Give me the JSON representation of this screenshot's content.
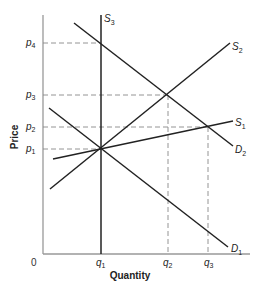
{
  "diagram": {
    "type": "supply-demand",
    "axes": {
      "x_label": "Quantity",
      "y_label": "Price",
      "origin_label": "0",
      "color": "#999999"
    },
    "curve_color": "#222222",
    "guide_color": "#888888",
    "price_ticks": [
      {
        "id": "p4",
        "base": "p",
        "sub": "4",
        "y": 43
      },
      {
        "id": "p3",
        "base": "p",
        "sub": "3",
        "y": 95
      },
      {
        "id": "p2",
        "base": "p",
        "sub": "2",
        "y": 127
      },
      {
        "id": "p1",
        "base": "p",
        "sub": "1",
        "y": 149
      }
    ],
    "quantity_ticks": [
      {
        "id": "q1",
        "base": "q",
        "sub": "1",
        "x": 101
      },
      {
        "id": "q2",
        "base": "q",
        "sub": "2",
        "x": 168
      },
      {
        "id": "q3",
        "base": "q",
        "sub": "3",
        "x": 208
      }
    ],
    "curves": [
      {
        "id": "S3",
        "base": "S",
        "sub": "3",
        "kind": "supply",
        "x1": 101,
        "y1": 15,
        "x2": 101,
        "y2": 254
      },
      {
        "id": "S2",
        "base": "S",
        "sub": "2",
        "kind": "supply",
        "x1": 50,
        "y1": 189,
        "x2": 230,
        "y2": 43
      },
      {
        "id": "S1",
        "base": "S",
        "sub": "1",
        "kind": "supply",
        "x1": 53,
        "y1": 159,
        "x2": 233,
        "y2": 121
      },
      {
        "id": "D2",
        "base": "D",
        "sub": "2",
        "kind": "demand",
        "x1": 74,
        "y1": 23,
        "x2": 233,
        "y2": 146
      },
      {
        "id": "D1",
        "base": "D",
        "sub": "1",
        "kind": "demand",
        "x1": 49,
        "y1": 108,
        "x2": 228,
        "y2": 247
      }
    ],
    "equilibria": [
      {
        "label": "p1,q1",
        "x": 101,
        "y": 149
      },
      {
        "label": "p2,q3",
        "x": 208,
        "y": 127
      },
      {
        "label": "p3,q2",
        "x": 168,
        "y": 95
      },
      {
        "label": "p4,q1",
        "x": 101,
        "y": 43
      }
    ]
  }
}
